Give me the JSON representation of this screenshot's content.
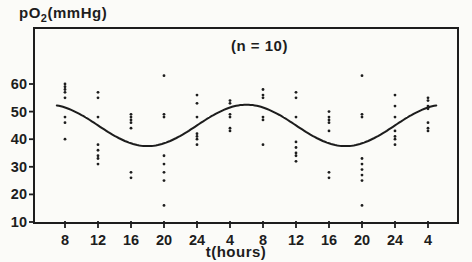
{
  "figure": {
    "y_axis_label": {
      "prefix": "p",
      "letter": "O",
      "sub": "2",
      "suffix": "(mmHg)"
    },
    "annotation": "(n = 10)",
    "x_axis_label": "t(hours)"
  },
  "colors": {
    "ink": "#1d1d1d",
    "background": "#fbfbf8"
  },
  "chart_data": {
    "type": "scatter",
    "title": "pO2(mmHg)",
    "xlabel": "t(hours)",
    "ylabel": "pO2 (mmHg)",
    "annotation": "(n = 10)",
    "sample_size": 10,
    "grid": false,
    "legend": "none",
    "ylim": [
      10,
      65
    ],
    "yticks": [
      10,
      20,
      30,
      40,
      50,
      60
    ],
    "xticks": [
      {
        "t": 8,
        "label": "8"
      },
      {
        "t": 12,
        "label": "12"
      },
      {
        "t": 16,
        "label": "16"
      },
      {
        "t": 20,
        "label": "20"
      },
      {
        "t": 24,
        "label": "24"
      },
      {
        "t": 28,
        "label": "4"
      },
      {
        "t": 32,
        "label": "8"
      },
      {
        "t": 36,
        "label": "12"
      },
      {
        "t": 40,
        "label": "16"
      },
      {
        "t": 44,
        "label": "20"
      },
      {
        "t": 48,
        "label": "24"
      },
      {
        "t": 52,
        "label": "4"
      }
    ],
    "scatter": [
      {
        "t": 8,
        "label": "8",
        "values": [
          60,
          59,
          58,
          57,
          55,
          48,
          46,
          40
        ]
      },
      {
        "t": 12,
        "label": "12",
        "values": [
          57,
          55,
          48,
          38,
          36,
          34,
          33,
          31
        ]
      },
      {
        "t": 16,
        "label": "16",
        "values": [
          49,
          48,
          47,
          46,
          44,
          28,
          26
        ]
      },
      {
        "t": 20,
        "label": "20",
        "values": [
          63,
          49,
          48,
          34,
          31,
          28,
          25,
          16
        ]
      },
      {
        "t": 24,
        "label": "24",
        "values": [
          56,
          53,
          48,
          42,
          41,
          40,
          38
        ]
      },
      {
        "t": 28,
        "label": "4",
        "values": [
          54,
          53,
          49,
          48,
          44,
          43
        ]
      },
      {
        "t": 32,
        "label": "8",
        "values": [
          58,
          56,
          55,
          48,
          47,
          38
        ]
      },
      {
        "t": 36,
        "label": "12",
        "values": [
          57,
          55,
          48,
          39,
          37,
          35,
          34,
          32
        ]
      },
      {
        "t": 40,
        "label": "16",
        "values": [
          50,
          48,
          47,
          46,
          43,
          28,
          26
        ]
      },
      {
        "t": 44,
        "label": "20",
        "values": [
          63,
          49,
          48,
          33,
          31,
          29,
          27,
          25,
          16
        ]
      },
      {
        "t": 48,
        "label": "24",
        "values": [
          56,
          52,
          48,
          43,
          41,
          40,
          38
        ]
      },
      {
        "t": 52,
        "label": "4",
        "values": [
          55,
          54,
          52,
          51,
          46,
          44,
          43
        ]
      }
    ],
    "fitted_curve": {
      "model": "cosinor",
      "mesor": 45,
      "amplitude": 7.5,
      "period_hours": 24,
      "peak_hour": 6,
      "trough_hour": 18,
      "t_start": 7,
      "t_end": 53
    }
  }
}
